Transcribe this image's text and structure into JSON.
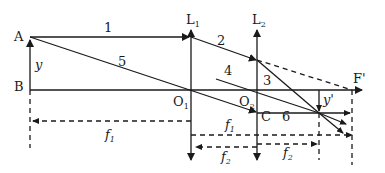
{
  "diagram": {
    "type": "optics-two-lens-ray-diagram",
    "colors": {
      "line": "#1a1a1a",
      "background": "#ffffff"
    },
    "points": {
      "A": {
        "label": "A"
      },
      "B": {
        "label": "B"
      },
      "O1": {
        "label": "O",
        "sub": "1"
      },
      "O2": {
        "label": "O",
        "sub": "2"
      },
      "C": {
        "label": "C"
      },
      "F_prime": {
        "label": "F'"
      }
    },
    "lenses": [
      {
        "label": "L",
        "sub": "1"
      },
      {
        "label": "L",
        "sub": "2"
      }
    ],
    "rays": [
      {
        "label": "1"
      },
      {
        "label": "2"
      },
      {
        "label": "3"
      },
      {
        "label": "4"
      },
      {
        "label": "5"
      },
      {
        "label": "6"
      }
    ],
    "dimensions": {
      "object_height": "y",
      "image_height": "y'",
      "f1_left": {
        "label": "f",
        "sub": "1"
      },
      "f1_right": {
        "label": "f",
        "sub": "1"
      },
      "f2_left": {
        "label": "f",
        "sub": "2"
      },
      "f2_right": {
        "label": "f",
        "sub": "2"
      }
    }
  }
}
